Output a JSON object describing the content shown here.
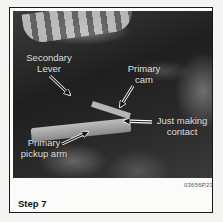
{
  "figure": {
    "labels": {
      "secondary_lever": "Secondary\nLever",
      "secondary_lever_line1": "Secondary",
      "secondary_lever_line2": "Lever",
      "primary_cam_line1": "Primary",
      "primary_cam_line2": "cam",
      "contact_line1": "Just making",
      "contact_line2": "contact",
      "pickup_line1": "Primary",
      "pickup_line2": "pickup arm"
    },
    "image_code": "03656P23",
    "caption": "Step 7"
  }
}
